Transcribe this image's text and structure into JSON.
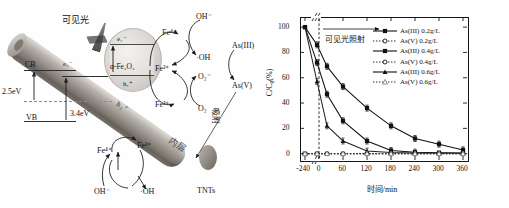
{
  "figure": {
    "left_panel": {
      "name": "photocatalytic-mechanism-diagram",
      "light_label": "可见光",
      "band": {
        "cb_label": "CB",
        "vb_label": "VB",
        "gap_left": "2.5eV",
        "gap_right": "3.4eV"
      },
      "catalyst_label": "α-Fe₂O₃",
      "carriers": {
        "electron": "e₁⁻",
        "hole": "h₁⁺",
        "electron2": "e₂⁻",
        "hole2": "h₂⁺"
      },
      "tube_label_inner": "内层",
      "tube_label_outer": "外层",
      "substrate_label": "TNTs",
      "adsorption_label": "吸附",
      "species": {
        "fe4_top": "Fe⁴⁺",
        "fe3_mid": "Fe³⁺",
        "fe2_bottom": "Fe²⁺",
        "fe4_lower": "Fe⁴⁺",
        "fe3_lower": "Fe³⁺",
        "hydroxide_top": "OH⁻",
        "hydroxyl_radical_top": "·OH",
        "superoxide": "O₂⁻",
        "oxygen": "O₂",
        "hydroxide_bottom": "OH⁻",
        "hydroxyl_radical_bottom": "·OH",
        "as3": "As(III)",
        "as5": "As(V)"
      }
    },
    "right_panel": {
      "name": "degradation-kinetics-chart"
    }
  },
  "chart_data": {
    "type": "line",
    "title": "",
    "xlabel": "时间/min",
    "ylabel": "C/C₀(%)",
    "xlim": [
      -240,
      360
    ],
    "ylim": [
      -5,
      108
    ],
    "xticks": [
      -240,
      0,
      60,
      120,
      180,
      240,
      300,
      360
    ],
    "yticks": [
      0,
      20,
      40,
      60,
      80,
      100
    ],
    "grid": false,
    "axis_break": true,
    "axis_break_note": "broken x-axis between -240 and 0 (dark adsorption period)",
    "legend_position": "top-right-inside",
    "annotations": [
      {
        "text": "可见光照射",
        "x": 30,
        "y": 95,
        "arrow": "right"
      }
    ],
    "vline": {
      "x": -5,
      "style": "dashed",
      "note": "light on"
    },
    "hline": {
      "y": 0,
      "style": "dotted"
    },
    "series": [
      {
        "name": "As(III) 0.2g/L",
        "marker": "filled-square",
        "linestyle": "solid",
        "x": [
          -240,
          -5,
          20,
          60,
          120,
          180,
          240,
          300,
          360
        ],
        "y": [
          100,
          86,
          69,
          53,
          36,
          22,
          12,
          7.5,
          3
        ]
      },
      {
        "name": "As(V) 0.2g/L",
        "marker": "open-circle",
        "linestyle": "dotted",
        "x": [
          -240,
          -5,
          20,
          60,
          120,
          180,
          240,
          300,
          360
        ],
        "y": [
          0,
          0,
          0,
          0,
          0,
          0,
          0,
          0,
          0
        ]
      },
      {
        "name": "As(III) 0.4g/L",
        "marker": "filled-square",
        "linestyle": "solid",
        "x": [
          -240,
          -5,
          20,
          60,
          120,
          180,
          240,
          300,
          360
        ],
        "y": [
          100,
          72,
          47,
          26,
          10,
          2.5,
          1.2,
          0.8,
          0.6
        ]
      },
      {
        "name": "As(V) 0.4g/L",
        "marker": "open-circle",
        "linestyle": "dotted",
        "x": [
          -240,
          -5,
          20,
          60,
          120,
          180,
          240,
          300,
          360
        ],
        "y": [
          0,
          0,
          0,
          0,
          0,
          0,
          0,
          0,
          0
        ]
      },
      {
        "name": "As(III) 0.6g/L",
        "marker": "filled-triangle",
        "linestyle": "solid",
        "x": [
          -240,
          -5,
          20,
          60,
          120,
          180,
          240,
          300,
          360
        ],
        "y": [
          100,
          57,
          22,
          10,
          2,
          1,
          0.6,
          0.5,
          0.4
        ]
      },
      {
        "name": "As(V) 0.6g/L",
        "marker": "open-triangle",
        "linestyle": "dotted",
        "x": [
          -240,
          -5,
          20,
          60,
          120,
          180,
          240,
          300,
          360
        ],
        "y": [
          0,
          0,
          0,
          0,
          0,
          0,
          0,
          0,
          0
        ]
      }
    ]
  }
}
